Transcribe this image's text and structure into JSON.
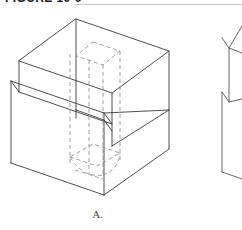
{
  "page": {
    "width": 242,
    "height": 230,
    "background_color": "#ffffff"
  },
  "caption": {
    "text": "FIGURE 10-9",
    "rule_color": "#c9c9cd"
  },
  "figures": [
    {
      "id": "figure-a",
      "label": "A.",
      "description": "Isometric pictorial of a stepped rectangular block with a vertical rectangular through-hole shown in hidden (dashed) lines",
      "visible_line_color": "#3a3a42",
      "hidden_line_color": "#8d8d96",
      "position": "left",
      "cropped": false
    },
    {
      "id": "figure-b",
      "label": "B.",
      "description": "Second isometric pictorial, cropped by the right edge of the image",
      "visible_line_color": "#55555e",
      "hidden_line_color": "#8d8d96",
      "position": "right",
      "cropped": true
    }
  ],
  "colors": {
    "visible_line": "#3a3a42",
    "hidden_line": "#8d8d96",
    "cropped_figure_line": "#55555e",
    "caption_text": "#1b1b1b",
    "label_text": "#4a4a4a",
    "rule": "#c9c9cd",
    "background": "#ffffff"
  }
}
